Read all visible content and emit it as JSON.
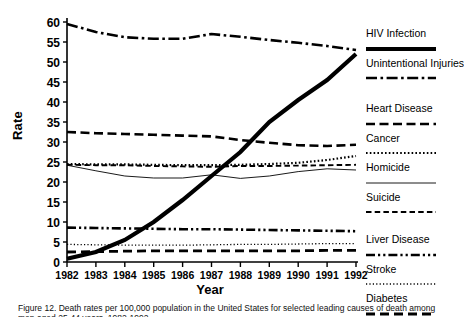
{
  "axes": {
    "ylabel": "Rate",
    "xlabel": "Year",
    "yticks": [
      0,
      5,
      10,
      15,
      20,
      25,
      30,
      35,
      40,
      45,
      50,
      55,
      60
    ],
    "xticks": [
      "1982",
      "1983",
      "1984",
      "1985",
      "1986",
      "1987",
      "1988",
      "1989",
      "1990",
      "1991",
      "1992"
    ]
  },
  "legend": [
    {
      "name": "HIV Infection",
      "style": "thick-solid"
    },
    {
      "name": "Unintentional Injuries",
      "style": "dash-dot"
    },
    {
      "name": "Heart Disease",
      "style": "dashed"
    },
    {
      "name": "Cancer",
      "style": "dotted"
    },
    {
      "name": "Homicide",
      "style": "thin-solid"
    },
    {
      "name": "Suicide",
      "style": "medium-dashed"
    },
    {
      "name": "Liver Disease",
      "style": "dash-dot-dot"
    },
    {
      "name": "Stroke",
      "style": "fine-dotted"
    },
    {
      "name": "Diabetes",
      "style": "long-dash"
    }
  ],
  "caption": "Figure 12. Death rates per 100,000 population in the United States for selected leading causes of death among men aged 25-44 years, 1982-1992.",
  "chart_data": {
    "type": "line",
    "title": "",
    "xlabel": "Year",
    "ylabel": "Rate",
    "xlim": [
      1982,
      1992
    ],
    "ylim": [
      0,
      60
    ],
    "grid": false,
    "legend_position": "right",
    "x": [
      1982,
      1983,
      1984,
      1985,
      1986,
      1987,
      1988,
      1989,
      1990,
      1991,
      1992
    ],
    "series": [
      {
        "name": "HIV Infection",
        "style": "thick-solid",
        "values": [
          0.8,
          2.5,
          5.5,
          10.0,
          15.5,
          21.5,
          27.5,
          35.0,
          40.5,
          45.5,
          52.0
        ]
      },
      {
        "name": "Unintentional Injuries",
        "style": "dash-dot",
        "values": [
          59.5,
          57.5,
          56.2,
          55.8,
          55.8,
          57.0,
          56.3,
          55.5,
          54.8,
          54.0,
          53.0
        ]
      },
      {
        "name": "Heart Disease",
        "style": "dashed",
        "values": [
          32.5,
          32.2,
          32.0,
          31.8,
          31.6,
          31.4,
          30.5,
          29.8,
          29.2,
          29.0,
          29.3
        ]
      },
      {
        "name": "Cancer",
        "style": "dotted",
        "values": [
          24.5,
          24.4,
          24.4,
          24.3,
          24.2,
          24.2,
          24.3,
          24.5,
          24.8,
          25.5,
          26.5
        ]
      },
      {
        "name": "Homicide",
        "style": "thin-solid",
        "values": [
          24.2,
          22.8,
          21.5,
          21.0,
          21.0,
          21.8,
          20.9,
          21.5,
          22.6,
          23.3,
          23.0
        ]
      },
      {
        "name": "Suicide",
        "style": "medium-dashed",
        "values": [
          24.3,
          24.2,
          24.2,
          24.0,
          23.9,
          23.8,
          24.0,
          24.0,
          24.1,
          24.2,
          24.3
        ]
      },
      {
        "name": "Liver Disease",
        "style": "dash-dot-dot",
        "values": [
          8.6,
          8.5,
          8.4,
          8.3,
          8.2,
          8.2,
          8.1,
          8.0,
          7.9,
          7.8,
          7.7
        ]
      },
      {
        "name": "Stroke",
        "style": "fine-dotted",
        "values": [
          4.4,
          4.3,
          4.2,
          4.2,
          4.2,
          4.3,
          4.4,
          4.4,
          4.5,
          4.6,
          4.6
        ]
      },
      {
        "name": "Diabetes",
        "style": "long-dash",
        "values": [
          2.5,
          2.6,
          2.7,
          2.8,
          2.8,
          2.8,
          2.8,
          2.8,
          2.8,
          2.9,
          2.9
        ]
      }
    ]
  }
}
